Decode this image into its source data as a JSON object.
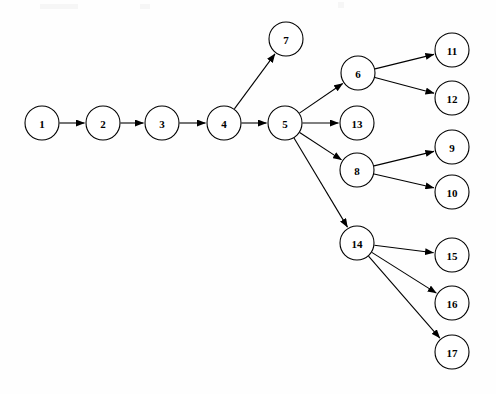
{
  "diagram": {
    "type": "directed-graph",
    "title": "",
    "background_color": "#fefefe",
    "node_fill_color": "#ffffff",
    "node_stroke_color": "#000000",
    "edge_color": "#000000",
    "node_radius": 17,
    "nodes": [
      {
        "id": "1",
        "label": "1",
        "cx": 42,
        "cy": 123,
        "r": 17
      },
      {
        "id": "2",
        "label": "2",
        "cx": 103,
        "cy": 123,
        "r": 17
      },
      {
        "id": "3",
        "label": "3",
        "cx": 162,
        "cy": 123,
        "r": 17
      },
      {
        "id": "4",
        "label": "4",
        "cx": 224,
        "cy": 123,
        "r": 17
      },
      {
        "id": "5",
        "label": "5",
        "cx": 285,
        "cy": 123,
        "r": 17
      },
      {
        "id": "7",
        "label": "7",
        "cx": 286,
        "cy": 39,
        "r": 17
      },
      {
        "id": "6",
        "label": "6",
        "cx": 358,
        "cy": 73,
        "r": 17
      },
      {
        "id": "13",
        "label": "13",
        "cx": 357,
        "cy": 123,
        "r": 17
      },
      {
        "id": "8",
        "label": "8",
        "cx": 357,
        "cy": 170,
        "r": 17
      },
      {
        "id": "14",
        "label": "14",
        "cx": 357,
        "cy": 243,
        "r": 17
      },
      {
        "id": "11",
        "label": "11",
        "cx": 452,
        "cy": 50,
        "r": 17
      },
      {
        "id": "12",
        "label": "12",
        "cx": 452,
        "cy": 98,
        "r": 17
      },
      {
        "id": "9",
        "label": "9",
        "cx": 452,
        "cy": 147,
        "r": 17
      },
      {
        "id": "10",
        "label": "10",
        "cx": 452,
        "cy": 192,
        "r": 17
      },
      {
        "id": "15",
        "label": "15",
        "cx": 452,
        "cy": 255,
        "r": 17
      },
      {
        "id": "16",
        "label": "16",
        "cx": 452,
        "cy": 303,
        "r": 17
      },
      {
        "id": "17",
        "label": "17",
        "cx": 452,
        "cy": 352,
        "r": 17
      }
    ],
    "edges": [
      {
        "from": "1",
        "to": "2"
      },
      {
        "from": "2",
        "to": "3"
      },
      {
        "from": "3",
        "to": "4"
      },
      {
        "from": "4",
        "to": "5"
      },
      {
        "from": "4",
        "to": "7"
      },
      {
        "from": "5",
        "to": "6"
      },
      {
        "from": "5",
        "to": "13"
      },
      {
        "from": "5",
        "to": "8"
      },
      {
        "from": "5",
        "to": "14"
      },
      {
        "from": "6",
        "to": "11"
      },
      {
        "from": "6",
        "to": "12"
      },
      {
        "from": "8",
        "to": "9"
      },
      {
        "from": "8",
        "to": "10"
      },
      {
        "from": "14",
        "to": "15"
      },
      {
        "from": "14",
        "to": "16"
      },
      {
        "from": "14",
        "to": "17"
      }
    ]
  }
}
